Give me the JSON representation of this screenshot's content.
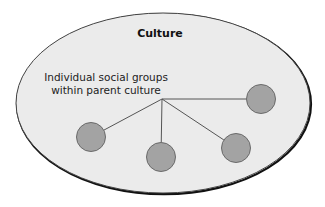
{
  "diagram": {
    "title": "Culture",
    "label_line1": "Individual social groups",
    "label_line2": "within parent culture",
    "colors": {
      "ellipse_fill": "#ebebeb",
      "ellipse_stroke": "#444444",
      "ellipse_shadow": "#111111",
      "group_fill": "#a3a3a3",
      "group_stroke": "#6a6a6a",
      "connector": "#555555"
    },
    "parent_culture": {
      "cx": 163,
      "cy": 103,
      "rx": 147,
      "ry": 90
    },
    "hub": {
      "x": 162,
      "y": 99
    },
    "groups": [
      {
        "name": "group-left",
        "cx": 91,
        "cy": 137,
        "r": 14.5
      },
      {
        "name": "group-bottom-center",
        "cx": 161,
        "cy": 157,
        "r": 14.5
      },
      {
        "name": "group-right-lower",
        "cx": 236,
        "cy": 148,
        "r": 14.5
      },
      {
        "name": "group-right-upper",
        "cx": 261,
        "cy": 99,
        "r": 14.5
      }
    ]
  }
}
